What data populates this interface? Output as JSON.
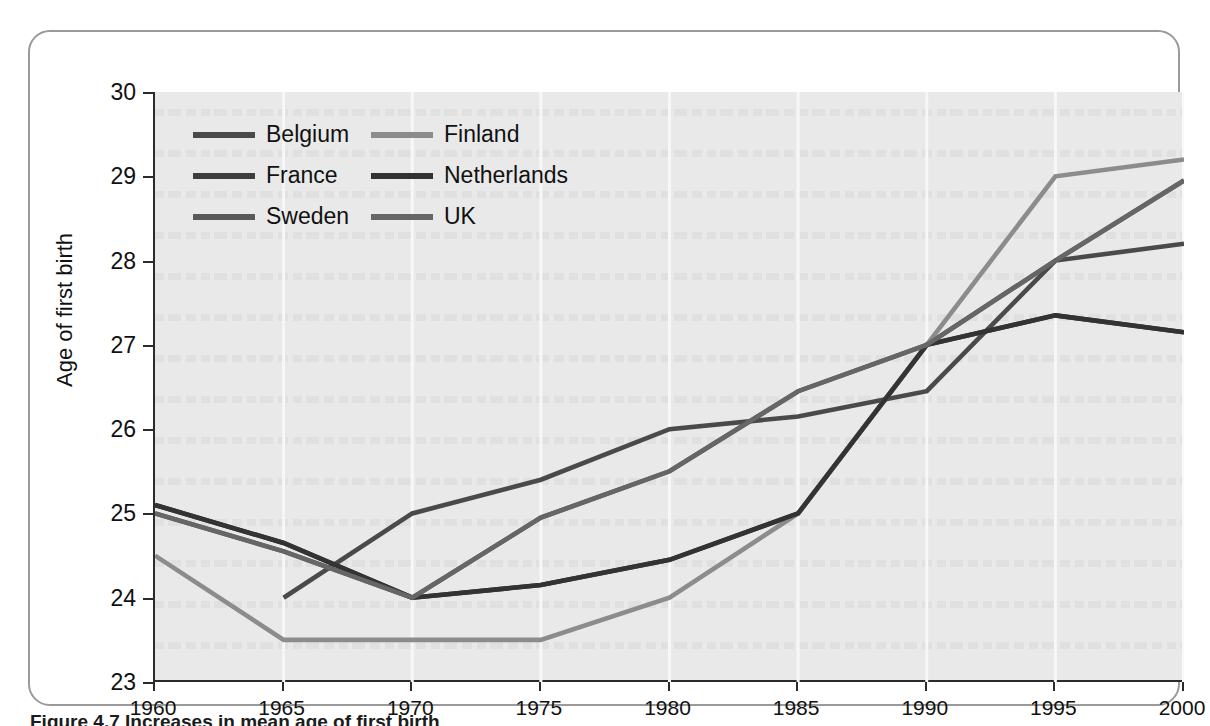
{
  "figure": {
    "caption_number": "Figure 4.7",
    "caption_text": "Increases in mean age of first birth"
  },
  "chart_data": {
    "type": "line",
    "title": "",
    "xlabel": "",
    "ylabel": "Age of first birth",
    "x": [
      1960,
      1965,
      1970,
      1975,
      1980,
      1985,
      1990,
      1995,
      2000
    ],
    "xlim": [
      1960,
      2000
    ],
    "ylim": [
      23,
      30
    ],
    "y_ticks": [
      23,
      24,
      25,
      26,
      27,
      28,
      29,
      30
    ],
    "x_ticks": [
      1960,
      1965,
      1970,
      1975,
      1980,
      1985,
      1990,
      1995,
      2000
    ],
    "grid": "vertical",
    "legend_position": "top-left",
    "series": [
      {
        "name": "Belgium",
        "color": "#4a4a4a",
        "x": [
          1965,
          1970,
          1975,
          1980,
          1985,
          1990,
          1995,
          2000
        ],
        "values": [
          24.0,
          25.0,
          25.4,
          26.0,
          26.15,
          26.45,
          28.0,
          28.2
        ]
      },
      {
        "name": "France",
        "color": "#3d3d3d",
        "x": [
          1960,
          1965,
          1970,
          1975,
          1980,
          1985,
          1990,
          1995,
          2000
        ],
        "values": [
          25.1,
          24.65,
          24.0,
          24.15,
          24.45,
          25.0,
          27.0,
          27.35,
          27.15
        ]
      },
      {
        "name": "Sweden",
        "color": "#595959",
        "x": [
          1960,
          1965,
          1970,
          1975,
          1980,
          1985,
          1990,
          1995,
          2000
        ],
        "values": [
          25.0,
          24.55,
          24.0,
          24.95,
          25.5,
          26.45,
          27.0,
          28.0,
          28.95
        ]
      },
      {
        "name": "Finland",
        "color": "#8c8c8c",
        "x": [
          1960,
          1965,
          1970,
          1975,
          1980,
          1985,
          1990,
          1995,
          2000
        ],
        "values": [
          24.5,
          23.5,
          23.5,
          23.5,
          24.0,
          25.0,
          27.0,
          29.0,
          29.2
        ]
      },
      {
        "name": "Netherlands",
        "color": "#333333",
        "x": [
          1960,
          1965,
          1970,
          1975,
          1980,
          1985,
          1990,
          1995,
          2000
        ],
        "values": [
          25.1,
          24.65,
          24.0,
          24.15,
          24.45,
          25.0,
          27.0,
          27.35,
          27.15
        ]
      },
      {
        "name": "UK",
        "color": "#666666",
        "x": [
          1960,
          1965,
          1970,
          1975,
          1980,
          1985,
          1990,
          1995,
          2000
        ],
        "values": [
          25.0,
          24.55,
          24.0,
          24.95,
          25.5,
          26.45,
          27.0,
          28.0,
          28.95
        ]
      }
    ],
    "plot_background": "#e9e9e9",
    "axis_color": "#2b2b2b",
    "gridline_color": "#f7f7f7"
  },
  "legend": {
    "entries": [
      {
        "label": "Belgium",
        "color": "#4a4a4a"
      },
      {
        "label": "Finland",
        "color": "#8c8c8c"
      },
      {
        "label": "France",
        "color": "#3d3d3d"
      },
      {
        "label": "Netherlands",
        "color": "#333333"
      },
      {
        "label": "Sweden",
        "color": "#595959"
      },
      {
        "label": "UK",
        "color": "#666666"
      }
    ]
  }
}
